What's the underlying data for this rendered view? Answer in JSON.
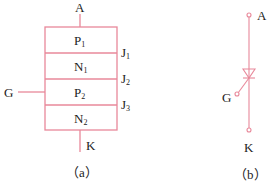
{
  "colors": {
    "stroke": "#e8889a",
    "text": "#222222"
  },
  "diagram_a": {
    "caption": "（a）",
    "terminals": {
      "anode": "A",
      "gate": "G",
      "cathode": "K"
    },
    "layers": [
      {
        "base": "P",
        "sub": "1"
      },
      {
        "base": "N",
        "sub": "1"
      },
      {
        "base": "P",
        "sub": "2"
      },
      {
        "base": "N",
        "sub": "2"
      }
    ],
    "junctions": [
      {
        "base": "J",
        "sub": "1"
      },
      {
        "base": "J",
        "sub": "2"
      },
      {
        "base": "J",
        "sub": "3"
      }
    ]
  },
  "diagram_b": {
    "caption": "（b）",
    "terminals": {
      "anode": "A",
      "gate": "G",
      "cathode": "K"
    }
  }
}
